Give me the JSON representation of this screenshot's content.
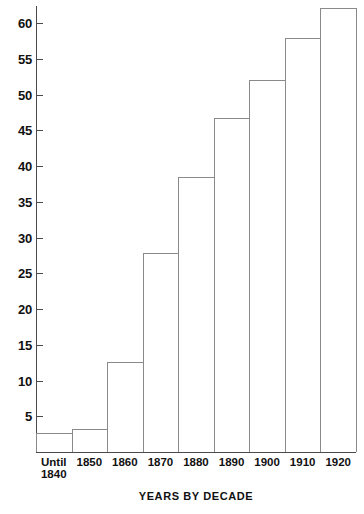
{
  "chart_data": {
    "type": "bar",
    "title": "",
    "xlabel": "YEARS BY DECADE",
    "ylabel": "",
    "categories": [
      "Until 1840",
      "1850",
      "1860",
      "1870",
      "1880",
      "1890",
      "1900",
      "1910",
      "1920"
    ],
    "category_lines": [
      [
        "Until",
        "1840"
      ],
      [
        "1850"
      ],
      [
        "1860"
      ],
      [
        "1870"
      ],
      [
        "1880"
      ],
      [
        "1890"
      ],
      [
        "1900"
      ],
      [
        "1910"
      ],
      [
        "1920"
      ]
    ],
    "values": [
      2.7,
      3.2,
      12.6,
      27.8,
      38.5,
      46.7,
      52.1,
      57.9,
      62.1
    ],
    "ylim": [
      0,
      62.5
    ],
    "yticks": [
      5,
      10,
      15,
      20,
      25,
      30,
      35,
      40,
      45,
      50,
      55,
      60
    ],
    "ytick_labels": [
      "5",
      "10",
      "15",
      "20",
      "25",
      "30",
      "35",
      "40",
      "45",
      "50",
      "55",
      "60"
    ],
    "grid": false,
    "legend": false,
    "bar_fill_color": "#ffffff",
    "bar_border_color": "#8a8a8a",
    "axis_color": "#4a4a4a",
    "text_color": "#111111",
    "background_color": "#ffffff"
  }
}
